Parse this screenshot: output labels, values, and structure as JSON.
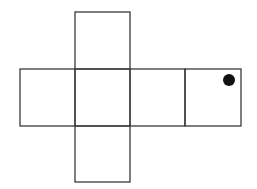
{
  "diagram": {
    "type": "cube-net",
    "stroke_color": "#3a3a3a",
    "dot_color": "#111111",
    "faces": [
      {
        "id": "top",
        "x": 75,
        "y": 12,
        "w": 55,
        "h": 57
      },
      {
        "id": "left",
        "x": 20,
        "y": 69,
        "w": 55,
        "h": 57
      },
      {
        "id": "center",
        "x": 75,
        "y": 69,
        "w": 55,
        "h": 57
      },
      {
        "id": "right",
        "x": 130,
        "y": 69,
        "w": 55,
        "h": 57
      },
      {
        "id": "far-right",
        "x": 185,
        "y": 69,
        "w": 56,
        "h": 57
      },
      {
        "id": "bottom",
        "x": 75,
        "y": 126,
        "w": 55,
        "h": 56
      }
    ],
    "dot": {
      "face": "far-right",
      "cx": 229,
      "cy": 80,
      "r": 6
    }
  }
}
